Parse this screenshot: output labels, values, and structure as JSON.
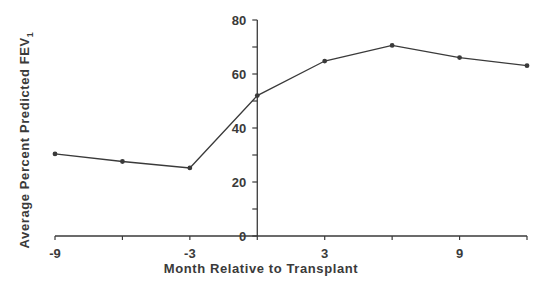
{
  "chart_data": {
    "type": "line",
    "title": "",
    "xlabel": "Month Relative to Transplant",
    "ylabel": "Average Percent Predicted FEV",
    "ylabel_subscript": "1",
    "x": [
      -9,
      -6,
      -3,
      0,
      3,
      6,
      9,
      12
    ],
    "series": [
      {
        "name": "Average Percent Predicted FEV1",
        "values": [
          30.4,
          27.6,
          25.2,
          52.0,
          64.8,
          70.6,
          66.1,
          63.1
        ]
      }
    ],
    "xlim": [
      -9,
      12
    ],
    "ylim": [
      0,
      80
    ],
    "x_tick_labels": [
      "-9",
      "-3",
      "3",
      "9"
    ],
    "x_tick_values": [
      -9,
      -6,
      -3,
      0,
      3,
      6,
      9,
      12
    ],
    "y_tick_labels": [
      "0",
      "20",
      "40",
      "60",
      "80"
    ],
    "y_tick_values": [
      0,
      10,
      20,
      30,
      40,
      50,
      60,
      70,
      80
    ],
    "grid": false,
    "legend": "none",
    "line_color": "#3a3a3a"
  }
}
